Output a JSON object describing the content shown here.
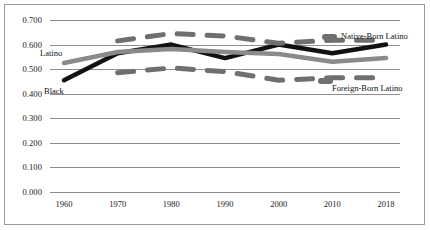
{
  "chart_data": {
    "type": "line",
    "title": "",
    "xlabel": "",
    "ylabel": "",
    "x": [
      1960,
      1970,
      1980,
      1990,
      2000,
      2010,
      2018
    ],
    "xticklabels": [
      "1960",
      "1970",
      "1980",
      "1990",
      "2000",
      "2010",
      "2018"
    ],
    "yticks": [
      0.0,
      0.1,
      0.2,
      0.3,
      0.4,
      0.5,
      0.6,
      0.7
    ],
    "yticklabels": [
      "0.000",
      "0.100",
      "0.200",
      "0.300",
      "0.400",
      "0.500",
      "0.600",
      "0.700"
    ],
    "ylim": [
      0.0,
      0.7
    ],
    "grid": "horizontal",
    "legend_position": "inline-annotations",
    "series": [
      {
        "name": "Black",
        "style": "solid",
        "color": "#111111",
        "label_position": "inline-left-below",
        "x": [
          1960,
          1970,
          1980,
          1990,
          2000,
          2010,
          2018
        ],
        "values": [
          0.455,
          0.565,
          0.6,
          0.545,
          0.6,
          0.565,
          0.6
        ]
      },
      {
        "name": "Latino",
        "style": "solid",
        "color": "#8a8a8a",
        "label_position": "inline-left-above",
        "x": [
          1960,
          1970,
          1980,
          1990,
          2000,
          2010,
          2018
        ],
        "values": [
          0.525,
          0.57,
          0.582,
          0.57,
          0.562,
          0.53,
          0.545
        ]
      },
      {
        "name": "Native-Born Latino",
        "style": "dashed",
        "color": "#6f6f6f",
        "label_position": "right-upper",
        "x": [
          1970,
          1980,
          1990,
          2000,
          2010,
          2018
        ],
        "values": [
          0.615,
          0.645,
          0.635,
          0.605,
          0.618,
          0.618
        ]
      },
      {
        "name": "Foreign-Born Latino",
        "style": "dashed",
        "color": "#6f6f6f",
        "label_position": "right-lower",
        "x": [
          1970,
          1980,
          1990,
          2000,
          2010,
          2018
        ],
        "values": [
          0.485,
          0.505,
          0.49,
          0.455,
          0.465,
          0.465
        ]
      }
    ],
    "annotations": [
      {
        "text": "Latino",
        "target": "Latino"
      },
      {
        "text": "Black",
        "target": "Black"
      },
      {
        "text": "Native-Born Latino",
        "target": "Native-Born Latino"
      },
      {
        "text": "Foreign-Born Latino",
        "target": "Foreign-Born Latino"
      }
    ]
  },
  "colors": {
    "background": "#ffffff",
    "frame": "#9a9a9a",
    "gridline": "#8e8e8e",
    "text": "#1a1a1a",
    "series_black": "#111111",
    "series_latino": "#8a8a8a",
    "series_dashed": "#6f6f6f"
  }
}
